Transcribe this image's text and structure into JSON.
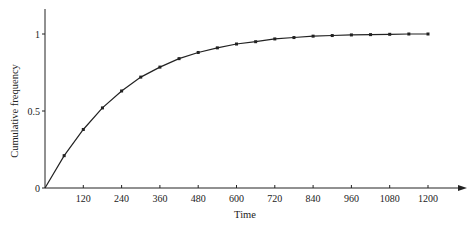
{
  "chart_data": {
    "type": "line",
    "title": "",
    "xlabel": "Time",
    "ylabel": "Cumulative frequency",
    "xlim": [
      0,
      1300
    ],
    "ylim": [
      0,
      1.15
    ],
    "grid": false,
    "legend": null,
    "x_ticks": [
      120,
      240,
      360,
      480,
      600,
      720,
      840,
      960,
      1080,
      1200
    ],
    "y_ticks": [
      0,
      0.5,
      1
    ],
    "y_tick_labels": [
      "0",
      "0.5",
      "1"
    ],
    "series": [
      {
        "name": "Cumulative frequency",
        "markers": true,
        "x": [
          0,
          60,
          120,
          180,
          240,
          300,
          360,
          420,
          480,
          540,
          600,
          660,
          720,
          780,
          840,
          900,
          960,
          1020,
          1080,
          1140,
          1200
        ],
        "y": [
          0,
          0.21,
          0.38,
          0.52,
          0.63,
          0.72,
          0.785,
          0.84,
          0.88,
          0.91,
          0.935,
          0.95,
          0.968,
          0.977,
          0.986,
          0.99,
          0.994,
          0.996,
          0.998,
          1.0,
          1.0
        ]
      }
    ]
  }
}
